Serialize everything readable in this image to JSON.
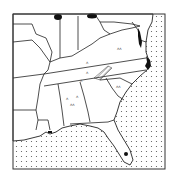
{
  "map": {
    "region": "Southeastern United States",
    "frame": {
      "x": 13,
      "y": 14,
      "width": 152,
      "height": 155
    },
    "colors": {
      "land": "#ffffff",
      "border": "#222222",
      "water_dots": "#555555",
      "highlight": "#111111"
    },
    "markers": {
      "filled_areas": [
        "top-left-blob",
        "top-center-blob",
        "chesapeake-area",
        "outer-banks-coast",
        "south-florida-dot",
        "louisiana-coast-mark"
      ],
      "hatched_area": "east-tennessee-nc-border",
      "small_symbols_count": 8
    }
  }
}
